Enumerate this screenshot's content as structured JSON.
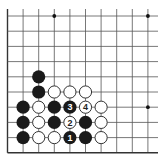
{
  "board": {
    "size": 19,
    "view": "lower-left quadrant",
    "grid": {
      "origin_x": 7.5,
      "origin_y": 16,
      "spacing_x": 15.6,
      "spacing_y": 15.2,
      "cols_visible": 10,
      "rows_visible": 10,
      "line_top": 9,
      "line_right": 158,
      "bottom_edge_row": 9,
      "left_edge_col": 0
    },
    "colors": {
      "background": "#ffffff",
      "line": "#555555",
      "edge": "#333333",
      "black_stone": "#1a1a1a",
      "white_stone_fill": "#ffffff",
      "white_stone_stroke": "#333333",
      "star": "#111111"
    },
    "star_points": [
      {
        "col": 3,
        "row": 0
      },
      {
        "col": 9,
        "row": 0
      },
      {
        "col": 9,
        "row": 6
      }
    ],
    "stones": [
      {
        "color": "black",
        "col": 2,
        "row": 4
      },
      {
        "color": "black",
        "col": 2,
        "row": 5
      },
      {
        "color": "white",
        "col": 3,
        "row": 5
      },
      {
        "color": "white",
        "col": 4,
        "row": 5
      },
      {
        "color": "white",
        "col": 5,
        "row": 5
      },
      {
        "color": "black",
        "col": 1,
        "row": 6
      },
      {
        "color": "white",
        "col": 2,
        "row": 6
      },
      {
        "color": "black",
        "col": 3,
        "row": 6
      },
      {
        "color": "black",
        "col": 4,
        "row": 6,
        "label": "3"
      },
      {
        "color": "white",
        "col": 5,
        "row": 6,
        "label": "4"
      },
      {
        "color": "white",
        "col": 6,
        "row": 6
      },
      {
        "color": "black",
        "col": 1,
        "row": 7
      },
      {
        "color": "white",
        "col": 2,
        "row": 7
      },
      {
        "color": "black",
        "col": 3,
        "row": 7
      },
      {
        "color": "white",
        "col": 4,
        "row": 7,
        "label": "2"
      },
      {
        "color": "black",
        "col": 5,
        "row": 7
      },
      {
        "color": "white",
        "col": 6,
        "row": 7
      },
      {
        "color": "black",
        "col": 1,
        "row": 8
      },
      {
        "color": "white",
        "col": 2,
        "row": 8
      },
      {
        "color": "white",
        "col": 3,
        "row": 8
      },
      {
        "color": "black",
        "col": 4,
        "row": 8,
        "label": "1"
      },
      {
        "color": "black",
        "col": 5,
        "row": 8
      },
      {
        "color": "white",
        "col": 6,
        "row": 8
      }
    ]
  }
}
